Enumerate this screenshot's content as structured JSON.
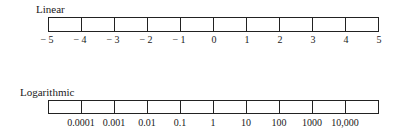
{
  "linear": {
    "title": "Linear",
    "labels": [
      "− 5",
      "− 4",
      "− 3",
      "− 2",
      "− 1",
      "0",
      "1",
      "2",
      "3",
      "4",
      "5"
    ]
  },
  "logarithmic": {
    "title": "Logarithmic",
    "labels": [
      "0.0001",
      "0.001",
      "0.01",
      "0.1",
      "1",
      "10",
      "100",
      "1000",
      "10,000"
    ]
  }
}
